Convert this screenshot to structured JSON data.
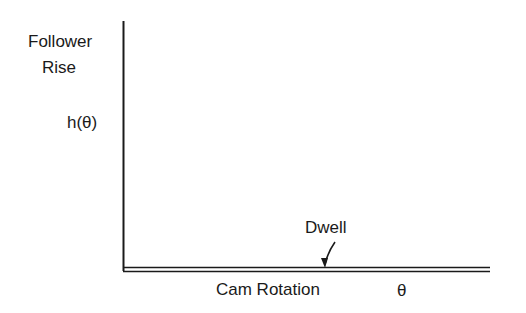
{
  "diagram": {
    "type": "cam-displacement-diagram",
    "y_axis": {
      "label_line1": "Follower",
      "label_line2": "Rise",
      "symbol": "h(θ)"
    },
    "x_axis": {
      "label": "Cam Rotation",
      "symbol": "θ"
    },
    "annotations": [
      {
        "text": "Dwell",
        "points_to": "horizontal double line (zero rise)"
      }
    ],
    "colors": {
      "ink": "#1a1a1a",
      "background": "#ffffff"
    }
  }
}
